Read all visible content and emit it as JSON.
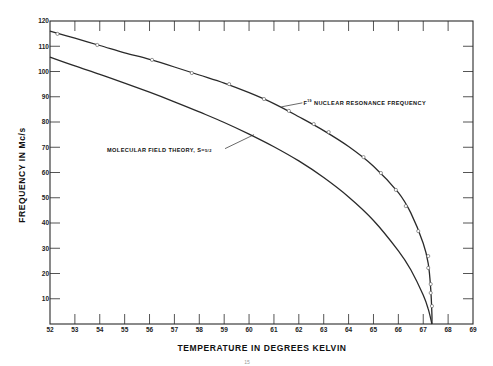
{
  "chart_data": {
    "type": "line",
    "title": "",
    "xlabel": "TEMPERATURE IN DEGREES KELVIN",
    "ylabel": "FREQUENCY IN Mc/s",
    "xlim": [
      52,
      69
    ],
    "ylim": [
      0,
      120
    ],
    "x_ticks": [
      52,
      53,
      54,
      55,
      56,
      57,
      58,
      59,
      60,
      61,
      62,
      63,
      64,
      65,
      66,
      67,
      68,
      69
    ],
    "y_ticks": [
      10,
      20,
      30,
      40,
      50,
      60,
      70,
      80,
      90,
      100,
      110,
      120
    ],
    "grid": false,
    "legend": null,
    "series": [
      {
        "name": "F19 nuclear resonance frequency",
        "kind": "curve with measured points",
        "curve": [
          [
            52.0,
            116.0
          ],
          [
            53.0,
            113.2
          ],
          [
            54.0,
            110.3
          ],
          [
            55.0,
            107.4
          ],
          [
            56.0,
            104.8
          ],
          [
            57.0,
            101.8
          ],
          [
            58.0,
            98.6
          ],
          [
            59.0,
            95.4
          ],
          [
            60.0,
            91.6
          ],
          [
            61.0,
            87.3
          ],
          [
            62.0,
            82.1
          ],
          [
            63.0,
            76.6
          ],
          [
            64.0,
            70.3
          ],
          [
            65.0,
            62.5
          ],
          [
            66.0,
            52.0
          ],
          [
            66.5,
            44.0
          ],
          [
            67.0,
            32.0
          ],
          [
            67.2,
            24.0
          ],
          [
            67.3,
            14.0
          ],
          [
            67.35,
            4.0
          ],
          [
            67.35,
            0.0
          ]
        ],
        "points": [
          [
            52.3,
            114.9
          ],
          [
            53.9,
            110.5
          ],
          [
            56.1,
            104.6
          ],
          [
            57.7,
            99.4
          ],
          [
            59.2,
            95.0
          ],
          [
            60.6,
            89.1
          ],
          [
            61.6,
            84.4
          ],
          [
            62.6,
            79.2
          ],
          [
            63.2,
            76.0
          ],
          [
            64.6,
            66.1
          ],
          [
            65.3,
            59.8
          ],
          [
            65.9,
            53.1
          ],
          [
            66.3,
            46.7
          ],
          [
            66.8,
            36.8
          ],
          [
            67.2,
            26.9
          ],
          [
            67.2,
            22.2
          ],
          [
            67.3,
            15.8
          ],
          [
            67.3,
            12.3
          ],
          [
            67.35,
            7.1
          ]
        ]
      },
      {
        "name": "Molecular field theory, S=5/2",
        "kind": "theoretical curve",
        "curve": [
          [
            52.0,
            105.7
          ],
          [
            53.0,
            102.2
          ],
          [
            54.0,
            98.9
          ],
          [
            55.0,
            95.4
          ],
          [
            56.0,
            91.8
          ],
          [
            57.0,
            88.0
          ],
          [
            58.0,
            84.0
          ],
          [
            59.0,
            79.8
          ],
          [
            60.0,
            75.2
          ],
          [
            61.0,
            70.2
          ],
          [
            62.0,
            64.6
          ],
          [
            63.0,
            58.0
          ],
          [
            64.0,
            50.3
          ],
          [
            65.0,
            41.0
          ],
          [
            66.0,
            29.0
          ],
          [
            66.5,
            21.5
          ],
          [
            67.0,
            11.5
          ],
          [
            67.2,
            6.0
          ],
          [
            67.35,
            0.0
          ]
        ]
      }
    ],
    "annotations": [
      {
        "text_main": "F",
        "text_sup": "19",
        "text_rest": " NUCLEAR  RESONANCE  FREQUENCY",
        "target_series": 0,
        "at": [
          61.3,
          86.0
        ]
      },
      {
        "text_main": "MOLECULAR  FIELD  THEORY,  S=",
        "text_frac": "5/2",
        "target_series": 1,
        "at": [
          60.2,
          75.0
        ]
      }
    ],
    "page_number": "15"
  }
}
